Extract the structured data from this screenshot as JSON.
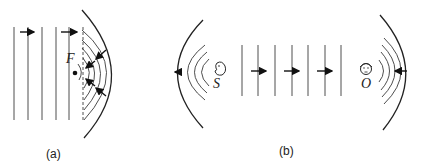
{
  "figure": {
    "panel_a": {
      "caption": "(a)",
      "focus_label": "F",
      "description": "Plane waves reflected by a concave mirror converging to focus F"
    },
    "panel_b": {
      "caption": "(b)",
      "source_label": "S",
      "observer_label": "O",
      "description": "Source S at focus of left mirror, plane waves travel to right mirror focusing on observer O"
    },
    "colors": {
      "line": "#2a2a2a",
      "background": "#ffffff"
    }
  }
}
